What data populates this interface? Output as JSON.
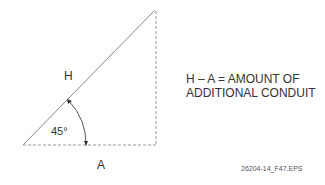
{
  "diagram": {
    "hypotenuse_label": "H",
    "adjacent_label": "A",
    "angle_label": "45°",
    "note_line1": "H – A = AMOUNT OF",
    "note_line2": "ADDITIONAL CONDUIT",
    "figure_id": "26204-14_F47.EPS",
    "colors": {
      "line": "#888888",
      "text": "#333333"
    }
  }
}
